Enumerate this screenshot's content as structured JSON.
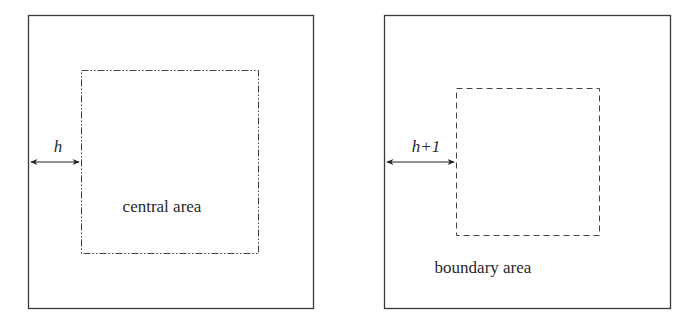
{
  "left_panel": {
    "distance_label": "h",
    "area_label": "central area",
    "inner_border_style": "dash-dot-dot"
  },
  "right_panel": {
    "distance_label": "h+1",
    "area_label": "boundary area",
    "inner_border_style": "dashed"
  },
  "colors": {
    "line": "#3a3a3a",
    "text": "#2a2a2a",
    "background": "#ffffff"
  }
}
